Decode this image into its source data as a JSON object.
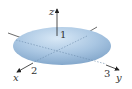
{
  "figure": {
    "type": "ellipsoid",
    "surface_color": "#a9c6e2",
    "axes": {
      "x": {
        "label": "x",
        "intercept_label": "2"
      },
      "y": {
        "label": "y",
        "intercept_label": "3"
      },
      "z": {
        "label": "z",
        "intercept_label": "1"
      }
    }
  }
}
